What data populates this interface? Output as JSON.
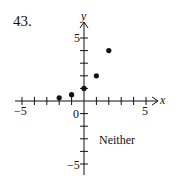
{
  "problem": {
    "number": "43."
  },
  "answer": "Neither",
  "chart_data": {
    "type": "scatter",
    "title": "",
    "xlabel": "x",
    "ylabel": "y",
    "xlim": [
      -5,
      5
    ],
    "ylim": [
      -5,
      5
    ],
    "x_tick_labels": [
      "-5",
      "0",
      "5"
    ],
    "y_tick_labels": [
      "5",
      "-5"
    ],
    "grid": false,
    "annotation": "Neither",
    "series": [
      {
        "name": "points",
        "x": [
          -2,
          -1,
          0,
          1,
          2
        ],
        "y": [
          0.25,
          0.5,
          1,
          2,
          4
        ]
      }
    ]
  },
  "labels": {
    "x_axis": "x",
    "y_axis": "y",
    "x_neg5": "−5",
    "x_pos5": "5",
    "origin": "0",
    "y_pos5": "5",
    "y_neg5": "−5"
  }
}
